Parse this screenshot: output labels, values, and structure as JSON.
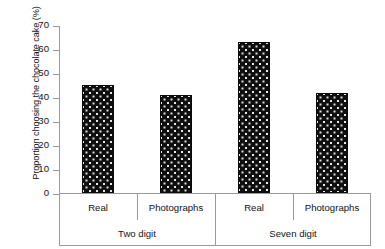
{
  "chart_data": {
    "type": "bar",
    "title": "",
    "xlabel": "",
    "ylabel": "Proportion choosing the chocolate cake (%)",
    "ylim": [
      0,
      70
    ],
    "yticks": [
      0,
      10,
      20,
      30,
      40,
      50,
      60,
      70
    ],
    "ytick_labels": [
      "0",
      "10",
      "20",
      "30",
      "40",
      "50",
      "60",
      "70"
    ],
    "grid": false,
    "legend": "none",
    "categories": [
      "Real",
      "Photographs",
      "Real",
      "Photographs"
    ],
    "groups": [
      {
        "label": "Two digit",
        "span": 2
      },
      {
        "label": "Seven digit",
        "span": 2
      }
    ],
    "values": [
      45,
      41,
      63,
      41.5
    ],
    "bars": [
      {
        "group": "Two digit",
        "category": "Real",
        "value": 45
      },
      {
        "group": "Two digit",
        "category": "Photographs",
        "value": 41
      },
      {
        "group": "Seven digit",
        "category": "Real",
        "value": 63
      },
      {
        "group": "Seven digit",
        "category": "Photographs",
        "value": 41.5
      }
    ],
    "bar_fill": "#100f0f",
    "bar_pattern": "white-dots",
    "axis_color": "#9a9a9a"
  }
}
